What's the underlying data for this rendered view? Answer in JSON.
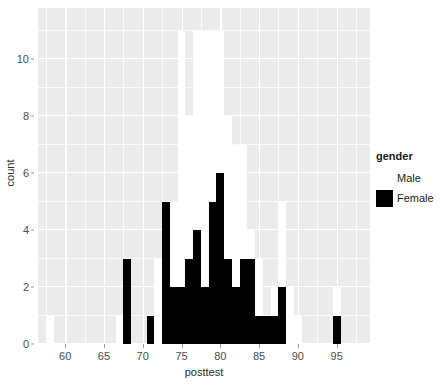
{
  "chart_data": {
    "type": "bar",
    "subtype": "stacked-histogram",
    "title": "",
    "xlabel": "posttest",
    "ylabel": "count",
    "xlim": [
      56.5,
      99.3
    ],
    "ylim": [
      0,
      11.8
    ],
    "x_ticks": [
      60,
      65,
      70,
      75,
      80,
      85,
      90,
      95
    ],
    "x_minor_ticks": [
      57.5,
      62.5,
      67.5,
      72.5,
      77.5,
      82.5,
      87.5,
      92.5,
      97.5
    ],
    "y_ticks": [
      0,
      2,
      4,
      6,
      8,
      10
    ],
    "y_minor_ticks": [
      1,
      3,
      5,
      7,
      9,
      11
    ],
    "grid": true,
    "legend_position": "right",
    "binwidth": 1,
    "categories": [
      58,
      59,
      60,
      61,
      62,
      63,
      64,
      65,
      66,
      67,
      68,
      69,
      70,
      71,
      72,
      73,
      74,
      75,
      76,
      77,
      78,
      79,
      80,
      81,
      82,
      83,
      84,
      85,
      86,
      87,
      88,
      89,
      90,
      91,
      92,
      93,
      94,
      95,
      96
    ],
    "series": [
      {
        "name": "Female",
        "color": "#000000",
        "values": [
          0,
          0,
          0,
          0,
          0,
          0,
          0,
          0,
          0,
          0,
          3,
          0,
          0,
          1,
          0,
          5,
          2,
          2,
          3,
          4,
          2,
          5,
          6,
          3,
          2,
          3,
          3,
          1,
          1,
          1,
          2,
          0,
          0,
          0,
          0,
          0,
          0,
          1,
          0
        ]
      },
      {
        "name": "Male",
        "color": "#ffffff",
        "values": [
          1,
          0,
          0,
          0,
          0,
          0,
          0,
          0,
          0,
          1,
          0,
          0,
          0,
          0,
          3,
          0,
          3,
          9,
          5,
          7,
          9,
          6,
          5,
          5,
          5,
          4,
          1,
          2,
          0,
          1,
          3,
          2,
          1,
          0,
          0,
          0,
          0,
          1,
          0
        ]
      }
    ],
    "totals": [
      1,
      0,
      0,
      0,
      0,
      0,
      0,
      0,
      0,
      1,
      3,
      0,
      0,
      1,
      3,
      5,
      5,
      11,
      8,
      11,
      11,
      11,
      11,
      8,
      7,
      7,
      4,
      3,
      1,
      2,
      5,
      2,
      1,
      0,
      0,
      0,
      0,
      2,
      0
    ]
  },
  "axes": {
    "y_title": "count",
    "x_title": "posttest",
    "y_tick_labels": [
      "0",
      "2",
      "4",
      "6",
      "8",
      "10"
    ],
    "x_tick_labels": [
      "60",
      "65",
      "70",
      "75",
      "80",
      "85",
      "90",
      "95"
    ]
  },
  "legend": {
    "title": "gender",
    "entries": [
      {
        "label": "Male",
        "color": "#ffffff"
      },
      {
        "label": "Female",
        "color": "#000000"
      }
    ]
  },
  "theme": {
    "panel_background": "#ebebeb",
    "grid_color": "#ffffff",
    "text_color": "#4d4d4d",
    "title_color": "#1a1a1a"
  }
}
